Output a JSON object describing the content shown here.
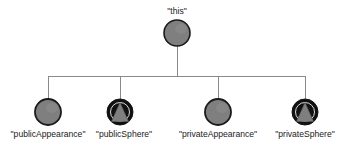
{
  "diagram": {
    "type": "object-reference-tree",
    "background_color": "#ffffff",
    "edge_color": "#8a8a8a",
    "label_color": "#1a1a1a",
    "root": {
      "label": "\"this\"",
      "shape": "circle",
      "fill": "#7f7f7f",
      "stroke": "#1a1a1a",
      "cx": 177,
      "cy": 33,
      "r": 13,
      "label_x": 177,
      "label_y": 14
    },
    "children": [
      {
        "label": "\"publicAppearance\"",
        "shape": "circle",
        "fill": "#7f7f7f",
        "stroke": "#1a1a1a",
        "cx": 48,
        "cy": 112,
        "r": 13,
        "label_x": 48,
        "label_y": 137
      },
      {
        "label": "\"publicSphere\"",
        "shape": "circle-with-triangle",
        "fill": "#111111",
        "stroke": "#111111",
        "triangle_fill": "#7f7f7f",
        "cx": 120,
        "cy": 112,
        "r": 13,
        "label_x": 124,
        "label_y": 137
      },
      {
        "label": "\"privateAppearance\"",
        "shape": "circle",
        "fill": "#7f7f7f",
        "stroke": "#1a1a1a",
        "cx": 218,
        "cy": 112,
        "r": 13,
        "label_x": 218,
        "label_y": 137
      },
      {
        "label": "\"privateSphere\"",
        "shape": "circle-with-triangle",
        "fill": "#111111",
        "stroke": "#111111",
        "triangle_fill": "#7f7f7f",
        "cx": 305,
        "cy": 112,
        "r": 13,
        "label_x": 305,
        "label_y": 137
      }
    ],
    "edges": {
      "trunk_x": 177,
      "trunk_top_y": 46,
      "bus_y": 76,
      "bus_left_x": 48,
      "bus_right_x": 305,
      "drop_xs": [
        48,
        120,
        218,
        305
      ],
      "drop_bottom_y": 99
    }
  }
}
